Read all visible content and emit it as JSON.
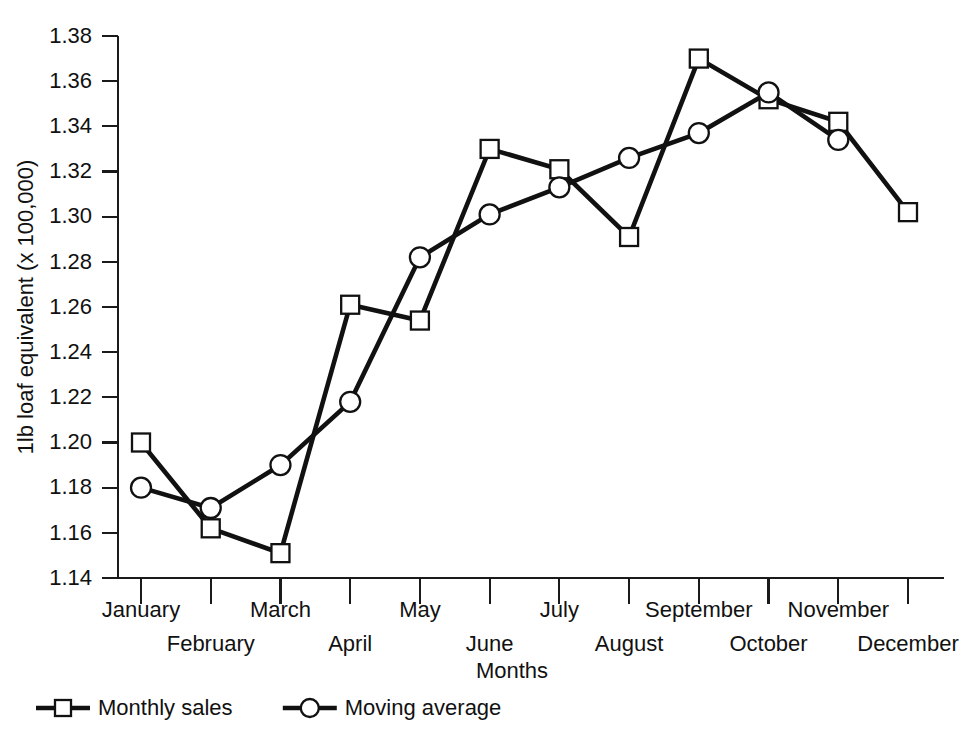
{
  "chart_data": {
    "type": "line",
    "title": "",
    "xlabel": "Months",
    "ylabel": "1lb loaf equivalent (x 100,000)",
    "categories": [
      "January",
      "February",
      "March",
      "April",
      "May",
      "June",
      "July",
      "August",
      "September",
      "October",
      "November",
      "December"
    ],
    "ylim": [
      1.14,
      1.38
    ],
    "ytick_step": 0.02,
    "ytick_labels": [
      "1.38",
      "1.36",
      "1.34",
      "1.32",
      "1.30",
      "1.28",
      "1.26",
      "1.24",
      "1.22",
      "1.20",
      "1.18",
      "1.16",
      "1.14"
    ],
    "ytick_values": [
      1.38,
      1.36,
      1.34,
      1.32,
      1.3,
      1.28,
      1.26,
      1.24,
      1.22,
      1.2,
      1.18,
      1.16,
      1.14
    ],
    "grid": false,
    "legend_position": "bottom-left",
    "series": [
      {
        "name": "Monthly sales",
        "marker": "square",
        "values": [
          1.2,
          1.162,
          1.151,
          1.261,
          1.254,
          1.33,
          1.321,
          1.291,
          1.37,
          1.352,
          1.342,
          1.302
        ]
      },
      {
        "name": "Moving average",
        "marker": "circle",
        "values": [
          1.18,
          1.171,
          1.19,
          1.218,
          1.282,
          1.301,
          1.313,
          1.326,
          1.337,
          1.355,
          1.334,
          null
        ]
      }
    ]
  },
  "legend": {
    "items": [
      {
        "label": "Monthly sales",
        "marker": "square"
      },
      {
        "label": "Moving average",
        "marker": "circle"
      }
    ]
  },
  "colors": {
    "line": "#111111",
    "marker_fill": "#ffffff",
    "axis": "#1a1a1a",
    "background": "#ffffff"
  }
}
